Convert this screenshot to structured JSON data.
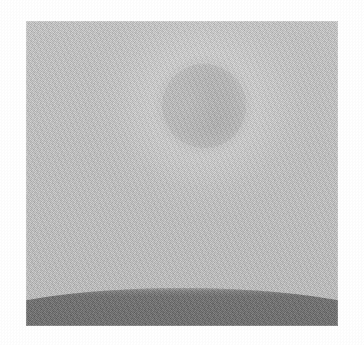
{
  "page": {
    "background_color": "#ffffff",
    "width": 364,
    "height": 345
  },
  "image_plate": {
    "name": "grayscale halftone photograph",
    "description": "Dithered black-and-white print of a pale sun disc high in a flat gray sky above a dark curved ground horizon",
    "x": 26,
    "y": 21,
    "width": 312,
    "height": 305,
    "rendering": "halftone dot screen / dithered bitmap",
    "palette": {
      "sky_top": "#cbcbcb",
      "sky_bottom": "#c2c2c2",
      "sun_disc": "#bdbdbd",
      "sun_halo": "#d6d6d6",
      "ground_top": "#6d6d6d",
      "ground_bottom": "#626262",
      "paper": "#ffffff"
    }
  },
  "sky": {
    "name": "sky",
    "tone": "light gray",
    "top_color": "#cbcbcb",
    "bottom_color": "#c2c2c2"
  },
  "sun": {
    "name": "sun disc",
    "center_x": 178,
    "center_y": 85,
    "radius": 44,
    "diameter": 88,
    "fill_color": "#bdbdbd",
    "halo_color": "#d6d6d6",
    "halo_radius": 115,
    "note": "disc reads slightly darker than surrounding sky, ringed by a soft lighter glow"
  },
  "ground": {
    "name": "ground",
    "tone": "dark gray",
    "fill_color": "#686868",
    "horizon_peak_y": 288,
    "horizon_edge_y": 297,
    "curvature": "convex arc, highest at horizontal center, falling toward both side edges"
  },
  "texture": {
    "name": "halftone screen",
    "cell_size_px": 2,
    "type": "checkerboard dither"
  }
}
